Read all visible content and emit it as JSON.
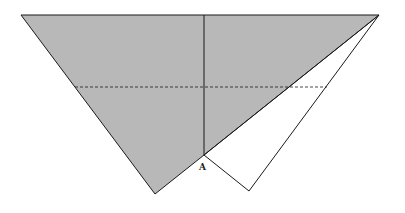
{
  "diagram": {
    "colors": {
      "shade": "#b8b8b8",
      "stroke": "#1a1a1a",
      "background": "#ffffff"
    },
    "points": {
      "top_left": [
        21,
        15
      ],
      "top_right": [
        379,
        15
      ],
      "fold_top": [
        204,
        15
      ],
      "A": [
        204,
        155
      ],
      "gray_bottom": [
        155,
        194
      ],
      "white_bottom": [
        249,
        191
      ],
      "dash_left": [
        75,
        87
      ],
      "dash_right": [
        327,
        87
      ]
    },
    "labels": {
      "A": "A"
    }
  }
}
